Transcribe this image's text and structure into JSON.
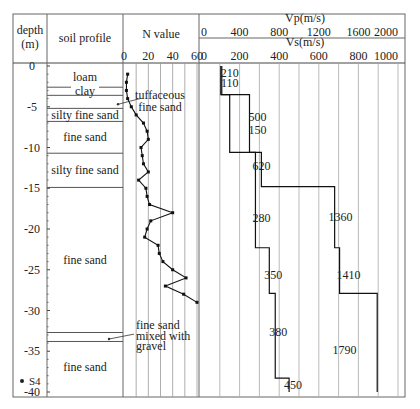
{
  "chart_data": {
    "type": "line",
    "title": "",
    "borehole_label": "S4",
    "depth_axis": {
      "label_line1": "depth",
      "label_line2": "(m)",
      "range": [
        0,
        -40
      ],
      "ticks": [
        0,
        -5,
        -10,
        -15,
        -20,
        -25,
        -30,
        -35,
        -40
      ]
    },
    "soil_profile": {
      "header": "soil profile",
      "layers": [
        {
          "name": "loam",
          "top": 0,
          "bottom": -2.6
        },
        {
          "name": "clay",
          "top": -2.6,
          "bottom": -3.6
        },
        {
          "name": "tuffaceous fine sand",
          "top": -3.6,
          "bottom": -5.2,
          "callout": true
        },
        {
          "name": "silty fine sand",
          "top": -5.2,
          "bottom": -6.8
        },
        {
          "name": "fine sand",
          "top": -6.8,
          "bottom": -10.7
        },
        {
          "name": "silty fine sand",
          "top": -10.7,
          "bottom": -14.9
        },
        {
          "name": "fine sand",
          "top": -14.9,
          "bottom": -32.7
        },
        {
          "name": "fine sand mixed with gravel",
          "top": -32.7,
          "bottom": -33.8,
          "callout": true
        },
        {
          "name": "fine sand",
          "top": -33.8,
          "bottom": -40
        }
      ],
      "callout_labels": {
        "tuffaceous": [
          "tuffaceous",
          "fine sand"
        ],
        "gravel": [
          "fine sand",
          "mixed with",
          "gravel"
        ]
      }
    },
    "n_value": {
      "header": "N value",
      "xlim": [
        0,
        60
      ],
      "ticks": [
        0,
        20,
        40,
        60
      ],
      "points": [
        {
          "depth": -1,
          "n": 3
        },
        {
          "depth": -2,
          "n": 2
        },
        {
          "depth": -3,
          "n": 2
        },
        {
          "depth": -4,
          "n": 3
        },
        {
          "depth": -5,
          "n": 6
        },
        {
          "depth": -6,
          "n": 10
        },
        {
          "depth": -7,
          "n": 16
        },
        {
          "depth": -8,
          "n": 19
        },
        {
          "depth": -9,
          "n": 20
        },
        {
          "depth": -10,
          "n": 14
        },
        {
          "depth": -11,
          "n": 15
        },
        {
          "depth": -12,
          "n": 16
        },
        {
          "depth": -13,
          "n": 20
        },
        {
          "depth": -14,
          "n": 12
        },
        {
          "depth": -15,
          "n": 18
        },
        {
          "depth": -16,
          "n": 19
        },
        {
          "depth": -17,
          "n": 21
        },
        {
          "depth": -18,
          "n": 40
        },
        {
          "depth": -19,
          "n": 22
        },
        {
          "depth": -20,
          "n": 19
        },
        {
          "depth": -21,
          "n": 17
        },
        {
          "depth": -22,
          "n": 28
        },
        {
          "depth": -23,
          "n": 29
        },
        {
          "depth": -24,
          "n": 32
        },
        {
          "depth": -25,
          "n": 40
        },
        {
          "depth": -26,
          "n": 51
        },
        {
          "depth": -27,
          "n": 34
        },
        {
          "depth": -28,
          "n": 49
        },
        {
          "depth": -29,
          "n": 60
        }
      ]
    },
    "velocity": {
      "vp_label": "Vp(m/s)",
      "vs_label": "Vs(m/s)",
      "vp_xlim": [
        0,
        2000
      ],
      "vp_ticks": [
        0,
        400,
        800,
        1200,
        1600,
        2000
      ],
      "vs_xlim": [
        0,
        1000
      ],
      "vs_ticks": [
        0,
        200,
        400,
        600,
        800,
        1000
      ],
      "vp_layers": [
        {
          "top": 0,
          "bottom": -3.5,
          "value": 210
        },
        {
          "top": -3.5,
          "bottom": -10.6,
          "value": 500
        },
        {
          "top": -10.6,
          "bottom": -14.8,
          "value": 620
        },
        {
          "top": -14.8,
          "bottom": -22.3,
          "value": 1360
        },
        {
          "top": -22.3,
          "bottom": -27.9,
          "value": 1410
        },
        {
          "top": -27.9,
          "bottom": -40,
          "value": 1790
        }
      ],
      "vs_layers": [
        {
          "top": 0,
          "bottom": -3.5,
          "value": 110
        },
        {
          "top": -3.5,
          "bottom": -10.6,
          "value": 150
        },
        {
          "top": -10.6,
          "bottom": -22.3,
          "value": 280
        },
        {
          "top": -22.3,
          "bottom": -27.9,
          "value": 350
        },
        {
          "top": -27.9,
          "bottom": -38.3,
          "value": 380
        },
        {
          "top": -38.3,
          "bottom": -40,
          "value": 450
        }
      ],
      "labels": [
        {
          "text": "210",
          "depth": -0.9,
          "vs": 150
        },
        {
          "text": "110",
          "depth": -2.1,
          "vs": 150
        },
        {
          "text": "500",
          "depth": -6.2,
          "vs": 290
        },
        {
          "text": "150",
          "depth": -7.9,
          "vs": 290
        },
        {
          "text": "620",
          "depth": -12.3,
          "vs": 310
        },
        {
          "text": "280",
          "depth": -18.7,
          "vs": 310
        },
        {
          "text": "1360",
          "depth": -18.5,
          "vs": 710
        },
        {
          "text": "350",
          "depth": -25.6,
          "vs": 370
        },
        {
          "text": "1410",
          "depth": -25.6,
          "vs": 750
        },
        {
          "text": "380",
          "depth": -32.6,
          "vs": 395
        },
        {
          "text": "1790",
          "depth": -34.8,
          "vs": 730
        },
        {
          "text": "450",
          "depth": -39.2,
          "vs": 470
        }
      ]
    }
  }
}
